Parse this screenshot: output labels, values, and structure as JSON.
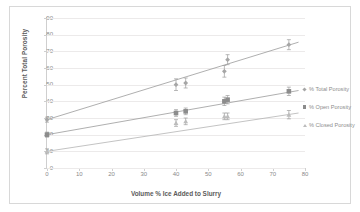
{
  "chart_data": {
    "type": "scatter",
    "title": "",
    "xlabel": "Volume % Ice Added to Slurry",
    "ylabel": "Percent Total Porosity",
    "xlim": [
      0,
      80
    ],
    "ylim": [
      0,
      90
    ],
    "xticks": [
      0,
      10,
      20,
      30,
      40,
      50,
      60,
      70,
      80
    ],
    "yticks": [
      0,
      10,
      20,
      30,
      40,
      50,
      60,
      70,
      80,
      90
    ],
    "grid": "horizontal",
    "legend_position": "right",
    "series": [
      {
        "name": "% Total Porosity",
        "marker": "diamond",
        "color": "#a6a6a6",
        "points": [
          {
            "x": 0,
            "y": 29,
            "yerr": 1.5
          },
          {
            "x": 40,
            "y": 50,
            "yerr": 3.5
          },
          {
            "x": 43,
            "y": 51,
            "yerr": 3.0
          },
          {
            "x": 55,
            "y": 58,
            "yerr": 3.5
          },
          {
            "x": 56,
            "y": 65,
            "yerr": 3.0
          },
          {
            "x": 75,
            "y": 74,
            "yerr": 3.0
          }
        ]
      },
      {
        "name": "% Open Porosity",
        "marker": "square",
        "color": "#8c8c8c",
        "points": [
          {
            "x": 0,
            "y": 20,
            "yerr": 1.5
          },
          {
            "x": 40,
            "y": 33,
            "yerr": 2.0
          },
          {
            "x": 43,
            "y": 34,
            "yerr": 2.0
          },
          {
            "x": 55,
            "y": 40,
            "yerr": 2.5
          },
          {
            "x": 56,
            "y": 41,
            "yerr": 2.5
          },
          {
            "x": 75,
            "y": 46,
            "yerr": 2.5
          }
        ]
      },
      {
        "name": "% Closed Porosity",
        "marker": "triangle",
        "color": "#bcbcbc",
        "points": [
          {
            "x": 0,
            "y": 10,
            "yerr": 1.5
          },
          {
            "x": 40,
            "y": 27,
            "yerr": 2.0
          },
          {
            "x": 43,
            "y": 28,
            "yerr": 2.0
          },
          {
            "x": 55,
            "y": 31,
            "yerr": 2.0
          },
          {
            "x": 56,
            "y": 31,
            "yerr": 2.0
          },
          {
            "x": 75,
            "y": 32,
            "yerr": 2.5
          }
        ]
      }
    ],
    "trendlines": [
      {
        "name": "% Total Porosity",
        "x0": 0,
        "y0": 29,
        "x1": 78,
        "y1": 75.5,
        "color": "#9a9a9a"
      },
      {
        "name": "% Open Porosity",
        "x0": 0,
        "y0": 20,
        "x1": 78,
        "y1": 46.5,
        "color": "#9a9a9a"
      },
      {
        "name": "% Closed Porosity",
        "x0": 0,
        "y0": 10,
        "x1": 78,
        "y1": 33.0,
        "color": "#b4b4b4"
      }
    ]
  },
  "legend": {
    "items": [
      {
        "label": "% Total Porosity",
        "marker": "diamond"
      },
      {
        "label": "% Open Porosity",
        "marker": "square"
      },
      {
        "label": "% Closed Porosity",
        "marker": "triangle"
      }
    ]
  }
}
